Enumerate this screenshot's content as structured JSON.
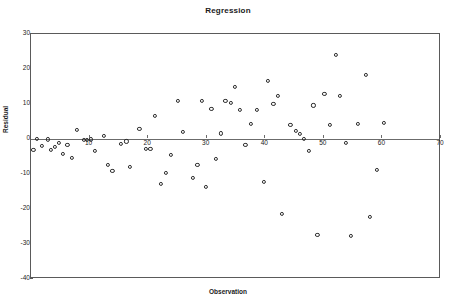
{
  "chart_data": {
    "type": "scatter",
    "title": "Regression",
    "xlabel": "Observation",
    "ylabel": "Residual",
    "xlim": [
      0,
      70
    ],
    "ylim": [
      -40,
      30
    ],
    "grid": false,
    "legend": null,
    "xticks": [
      10,
      20,
      30,
      40,
      50,
      60,
      70
    ],
    "yticks": [
      30,
      20,
      10,
      0,
      -10,
      -20,
      -30,
      -40
    ],
    "reference_line": 0,
    "series": [
      {
        "name": "Residual",
        "marker": "open-circle",
        "color": "#2b2b2b",
        "points": [
          {
            "x": 0.4,
            "y": -3.0
          },
          {
            "x": 1.0,
            "y": 0.1
          },
          {
            "x": 1.8,
            "y": -2.0
          },
          {
            "x": 2.9,
            "y": -0.1
          },
          {
            "x": 3.4,
            "y": -3.2
          },
          {
            "x": 4.1,
            "y": -2.3
          },
          {
            "x": 4.8,
            "y": -1.2
          },
          {
            "x": 5.4,
            "y": -4.3
          },
          {
            "x": 6.2,
            "y": -1.8
          },
          {
            "x": 7.0,
            "y": -5.3
          },
          {
            "x": 7.9,
            "y": 2.7
          },
          {
            "x": 9.0,
            "y": -0.2
          },
          {
            "x": 9.6,
            "y": -0.2
          },
          {
            "x": 10.2,
            "y": -0.1
          },
          {
            "x": 10.9,
            "y": -3.5
          },
          {
            "x": 12.5,
            "y": 0.9
          },
          {
            "x": 13.1,
            "y": -7.3
          },
          {
            "x": 13.9,
            "y": -9.0
          },
          {
            "x": 15.4,
            "y": -1.4
          },
          {
            "x": 16.3,
            "y": -0.7
          },
          {
            "x": 16.9,
            "y": -7.9
          },
          {
            "x": 18.5,
            "y": 2.9
          },
          {
            "x": 19.6,
            "y": -2.8
          },
          {
            "x": 20.4,
            "y": -2.9
          },
          {
            "x": 21.2,
            "y": 6.6
          },
          {
            "x": 22.2,
            "y": -12.8
          },
          {
            "x": 23.0,
            "y": -9.7
          },
          {
            "x": 23.9,
            "y": -4.5
          },
          {
            "x": 25.1,
            "y": 10.8
          },
          {
            "x": 26.0,
            "y": 2.1
          },
          {
            "x": 27.6,
            "y": -11.1
          },
          {
            "x": 28.4,
            "y": -7.3
          },
          {
            "x": 29.2,
            "y": 10.8
          },
          {
            "x": 29.9,
            "y": -13.8
          },
          {
            "x": 30.8,
            "y": 8.5
          },
          {
            "x": 31.6,
            "y": -5.7
          },
          {
            "x": 32.4,
            "y": 1.6
          },
          {
            "x": 33.2,
            "y": 10.8
          },
          {
            "x": 34.1,
            "y": 10.2
          },
          {
            "x": 34.8,
            "y": 14.9
          },
          {
            "x": 35.7,
            "y": 8.3
          },
          {
            "x": 36.6,
            "y": -1.8
          },
          {
            "x": 37.6,
            "y": 4.4
          },
          {
            "x": 38.5,
            "y": 8.2
          },
          {
            "x": 39.8,
            "y": -12.2
          },
          {
            "x": 40.5,
            "y": 16.5
          },
          {
            "x": 41.4,
            "y": 10.0
          },
          {
            "x": 42.1,
            "y": 12.3
          },
          {
            "x": 42.9,
            "y": -21.4
          },
          {
            "x": 44.3,
            "y": 4.1
          },
          {
            "x": 45.2,
            "y": 2.4
          },
          {
            "x": 45.9,
            "y": 1.4
          },
          {
            "x": 46.6,
            "y": 0.0
          },
          {
            "x": 47.4,
            "y": -3.4
          },
          {
            "x": 48.2,
            "y": 9.6
          },
          {
            "x": 48.9,
            "y": -27.3
          },
          {
            "x": 50.1,
            "y": 12.8
          },
          {
            "x": 51.0,
            "y": 4.1
          },
          {
            "x": 52.0,
            "y": 24.1
          },
          {
            "x": 52.8,
            "y": 12.2
          },
          {
            "x": 53.7,
            "y": -1.1
          },
          {
            "x": 54.6,
            "y": -27.8
          },
          {
            "x": 55.8,
            "y": 4.2
          },
          {
            "x": 57.2,
            "y": 18.3
          },
          {
            "x": 57.9,
            "y": -22.2
          },
          {
            "x": 59.1,
            "y": -8.8
          },
          {
            "x": 60.3,
            "y": 4.6
          }
        ]
      }
    ]
  }
}
